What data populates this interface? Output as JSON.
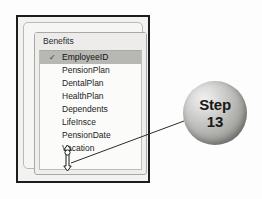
{
  "figure": {
    "kind": "database-table-field-list-with-step-callout"
  },
  "window": {
    "field_list": {
      "title": "Benefits",
      "primary_key_icon": "key-icon",
      "fields": [
        {
          "name": "EmployeeID",
          "is_primary_key": true,
          "selected": true
        },
        {
          "name": "PensionPlan",
          "is_primary_key": false,
          "selected": false
        },
        {
          "name": "DentalPlan",
          "is_primary_key": false,
          "selected": false
        },
        {
          "name": "HealthPlan",
          "is_primary_key": false,
          "selected": false
        },
        {
          "name": "Dependents",
          "is_primary_key": false,
          "selected": false
        },
        {
          "name": "LifeInsce",
          "is_primary_key": false,
          "selected": false
        },
        {
          "name": "PensionDate",
          "is_primary_key": false,
          "selected": false
        },
        {
          "name": "Vacation",
          "is_primary_key": false,
          "selected": false
        }
      ]
    },
    "resize_handle": {
      "icon": "vertical-resize-cursor-icon",
      "position": "bottom-border"
    }
  },
  "callout": {
    "label": "Step",
    "number": "13",
    "leader_line": "callout-leader-line"
  },
  "colors": {
    "frame_border": "#1d1d1d",
    "panel_background": "#f2f2f0",
    "list_background": "#fbfbfa",
    "selection_highlight": "#b7b7b3",
    "sphere_mid": "#a9a9a6",
    "text": "#1c1c1c"
  }
}
